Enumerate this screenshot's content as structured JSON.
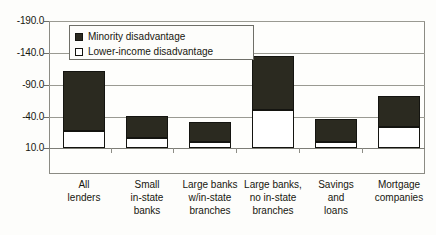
{
  "chart_data": {
    "type": "bar",
    "title": "",
    "subtitle": "",
    "xlabel": "",
    "ylabel": "",
    "stacked": true,
    "y_axis_inverted": true,
    "grid": true,
    "legend_position": "top-left-inside",
    "ylim": [
      -190.0,
      10.0
    ],
    "ytick_labels": [
      "-190.0",
      "-140.0",
      "-90.0",
      "-40.0",
      "10.0"
    ],
    "ytick_values": [
      -190.0,
      -140.0,
      -90.0,
      -40.0,
      10.0
    ],
    "categories": [
      "All lenders",
      "Small in-state banks",
      "Large banks w/in-state branches",
      "Large banks, no in-state branches",
      "Savings and loans",
      "Mortgage companies"
    ],
    "category_label_lines": [
      [
        "All",
        "lenders"
      ],
      [
        "Small",
        "in-state",
        "banks"
      ],
      [
        "Large banks",
        "w/in-state",
        "branches"
      ],
      [
        "Large banks,",
        "no in-state",
        "branches"
      ],
      [
        "Savings",
        "and",
        "loans"
      ],
      [
        "Mortgage",
        "companies"
      ]
    ],
    "series": [
      {
        "name": "Minority disadvantage",
        "color": "#2b2a20",
        "values": [
          -111.0,
          -40.0,
          -31.0,
          -135.0,
          -36.0,
          -72.0
        ]
      },
      {
        "name": "Lower-income disadvantage",
        "color": "#ffffff",
        "values": [
          -17.0,
          -6.0,
          0.0,
          -50.0,
          0.0,
          -23.0
        ]
      }
    ],
    "legend_entries": [
      {
        "label": "Minority disadvantage",
        "swatch": "filled"
      },
      {
        "label": "Lower-income disadvantage",
        "swatch": "hollow"
      }
    ]
  },
  "colors": {
    "minority": "#2b2a20",
    "lower_income": "#ffffff",
    "outline": "#141410",
    "grid": "#9a9a92",
    "frame": "#8b8b84",
    "background": "#fdfdfb"
  }
}
